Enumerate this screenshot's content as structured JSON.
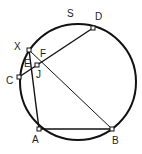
{
  "diagram": {
    "type": "circle-geometry",
    "circle": {
      "cx": 78,
      "cy": 82,
      "r": 58,
      "stroke_width": 2
    },
    "stroke_color": "#111111",
    "points": [
      {
        "id": "X",
        "label": "X",
        "x": 29,
        "y": 50,
        "lx": 14,
        "ly": 50
      },
      {
        "id": "D",
        "label": "D",
        "x": 93,
        "y": 28,
        "lx": 95,
        "ly": 20
      },
      {
        "id": "C",
        "label": "C",
        "x": 19,
        "y": 77,
        "lx": 6,
        "ly": 84
      },
      {
        "id": "A",
        "label": "A",
        "x": 39,
        "y": 129,
        "lx": 32,
        "ly": 143
      },
      {
        "id": "B",
        "label": "B",
        "x": 112,
        "y": 129,
        "lx": 112,
        "ly": 144
      },
      {
        "id": "J",
        "label": "J",
        "x": 37,
        "y": 65,
        "lx": 36,
        "ly": 78
      }
    ],
    "labels": [
      {
        "id": "S",
        "text": "S",
        "x": 67,
        "y": 17
      },
      {
        "id": "E",
        "text": "E",
        "x": 24,
        "y": 67
      },
      {
        "id": "F",
        "text": "F",
        "x": 40,
        "y": 57
      }
    ],
    "segments": [
      {
        "from": "X",
        "to": "A",
        "width": 1.4
      },
      {
        "from": "X",
        "to": "B",
        "width": 1
      },
      {
        "from": "C",
        "to": "D",
        "width": 1.4
      },
      {
        "from": "A",
        "to": "B",
        "width": 1.6
      }
    ]
  }
}
